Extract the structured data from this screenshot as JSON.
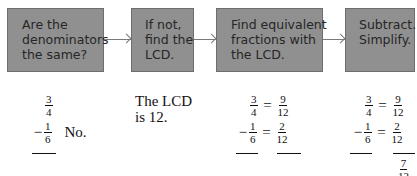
{
  "flowchart": {
    "steps": [
      {
        "lines": [
          "Are the",
          "denominators",
          "the same?"
        ]
      },
      {
        "lines": [
          "If not,",
          "find the",
          "LCD."
        ]
      },
      {
        "lines": [
          "Find equivalent",
          "fractions with",
          "the LCD."
        ]
      },
      {
        "lines": [
          "Subtract.",
          "Simplify."
        ]
      }
    ],
    "colors": {
      "box_fill": "#909090",
      "box_text": "#262626",
      "arrow": "#7a7a7a"
    }
  },
  "examples": {
    "step1": {
      "top": {
        "num": "3",
        "den": "4"
      },
      "bottom": {
        "op": "−",
        "num": "1",
        "den": "6"
      },
      "answer": "No."
    },
    "step2": {
      "lines": [
        "The LCD",
        "is 12."
      ]
    },
    "step3": {
      "top": {
        "num": "3",
        "den": "4",
        "eq": "=",
        "rnum": "9",
        "rden": "12"
      },
      "bottom": {
        "op": "−",
        "num": "1",
        "den": "6",
        "eq": "=",
        "rnum": "2",
        "rden": "12"
      }
    },
    "step4": {
      "top": {
        "num": "3",
        "den": "4",
        "eq": "=",
        "rnum": "9",
        "rden": "12"
      },
      "bottom": {
        "op": "−",
        "num": "1",
        "den": "6",
        "eq": "=",
        "rnum": "2",
        "rden": "12"
      },
      "result": {
        "num": "7",
        "den": "12"
      }
    }
  }
}
